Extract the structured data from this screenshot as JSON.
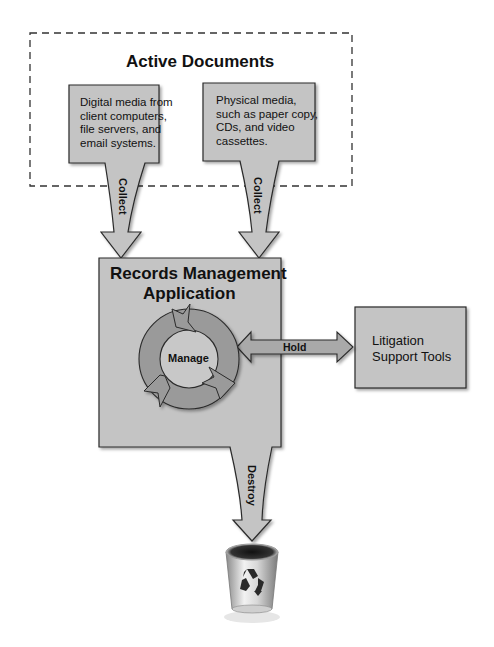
{
  "diagram": {
    "active_documents": {
      "title": "Active Documents",
      "boxes": [
        {
          "id": "digital",
          "lines": [
            "Digital media from",
            "client computers,",
            "file servers, and",
            "email systems."
          ]
        },
        {
          "id": "physical",
          "lines": [
            "Physical media,",
            "such as paper copy,",
            "CDs, and video",
            "cassettes."
          ]
        }
      ]
    },
    "flows": {
      "collect_left": "Collect",
      "collect_right": "Collect",
      "hold": "Hold",
      "destroy": "Destroy"
    },
    "records_app": {
      "title_line1": "Records Management",
      "title_line2": "Application",
      "cycle_label": "Manage"
    },
    "litigation": {
      "line1": "Litigation",
      "line2": "Support Tools"
    },
    "trash": {
      "icon": "recycle-bin-icon"
    },
    "colors": {
      "box_fill": "#c4c4c4",
      "box_stroke": "#2a2a2a",
      "arrow_fill": "#a9a9a9",
      "cycle_fill": "#9a9a9a",
      "dash": "#333333"
    }
  }
}
